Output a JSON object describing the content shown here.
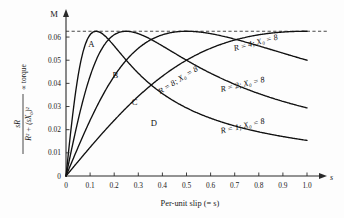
{
  "chart_data": {
    "type": "line",
    "title": "",
    "xlabel": "Per-unit slip (= s)",
    "x_axis_symbol": "s",
    "ylabel_numerator": "sR",
    "ylabel_denominator": "R² + (sX₀)²",
    "ylabel_suffix": "∝ torque",
    "y_axis_symbol": "M",
    "xlim": [
      0,
      1.0
    ],
    "ylim": [
      0,
      0.0665
    ],
    "grid": false,
    "legend_position": "inline-on-curves",
    "x_ticks": [
      "0",
      "0.1",
      "0.2",
      "0.3",
      "0.4",
      "0.5",
      "0.6",
      "0.7",
      "0.8",
      "0.9",
      "1.0"
    ],
    "x_tick_values": [
      0,
      0.1,
      0.2,
      0.3,
      0.4,
      0.5,
      0.6,
      0.7,
      0.8,
      0.9,
      1.0
    ],
    "y_ticks": [
      "0",
      "0.01",
      "0.02",
      "0.03",
      "0.04",
      "0.05",
      "0.06"
    ],
    "y_tick_values": [
      0,
      0.01,
      0.02,
      0.03,
      0.04,
      0.05,
      0.06
    ],
    "annotations": [
      {
        "name": "max-torque-line",
        "text": "",
        "kind": "dashed-horizontal",
        "y": 0.0625
      }
    ],
    "curve_letters": [
      {
        "label": "A",
        "x": 0.105,
        "y": 0.0555
      },
      {
        "label": "B",
        "x": 0.205,
        "y": 0.0425
      },
      {
        "label": "C",
        "x": 0.285,
        "y": 0.0305
      },
      {
        "label": "D",
        "x": 0.365,
        "y": 0.0215
      }
    ],
    "series": [
      {
        "name": "A",
        "label": "R = 1; X₀ = 8",
        "label_x": 0.735,
        "label_y": 0.0205,
        "label_rotate": -13,
        "R": 1,
        "X0": 8,
        "peak_x": 0.125,
        "peak_y": 0.0625,
        "x": [
          0.0,
          0.01,
          0.02,
          0.03,
          0.04,
          0.05,
          0.06,
          0.07,
          0.08,
          0.09,
          0.1,
          0.115,
          0.125,
          0.14,
          0.16,
          0.18,
          0.2,
          0.25,
          0.3,
          0.35,
          0.4,
          0.45,
          0.5,
          0.55,
          0.6,
          0.65,
          0.7,
          0.75,
          0.8,
          0.85,
          0.9,
          0.95,
          1.0
        ],
        "values": [
          0.0,
          0.00985,
          0.01923,
          0.02752,
          0.03448,
          0.04,
          0.04412,
          0.04717,
          0.04938,
          0.05096,
          0.05208,
          0.05298,
          0.05333,
          0.05348,
          0.05319,
          0.05251,
          0.05165,
          0.04898,
          0.04615,
          0.04348,
          0.04103,
          0.03883,
          0.03684,
          0.03505,
          0.03344,
          0.03198,
          0.03065,
          0.02944,
          0.02834,
          0.02732,
          0.02639,
          0.02552,
          0.02472
        ]
      },
      {
        "name": "B",
        "label": "R = 2; X₀ = 8",
        "label_x": 0.735,
        "label_y": 0.0385,
        "label_rotate": -13,
        "R": 2,
        "X0": 8,
        "peak_x": 0.25,
        "peak_y": 0.0625,
        "x": [
          0.0,
          0.02,
          0.04,
          0.06,
          0.08,
          0.1,
          0.13,
          0.16,
          0.19,
          0.22,
          0.25,
          0.28,
          0.32,
          0.36,
          0.4,
          0.45,
          0.5,
          0.55,
          0.6,
          0.65,
          0.7,
          0.75,
          0.8,
          0.85,
          0.9,
          0.95,
          1.0
        ],
        "values": [
          0.0,
          0.00995,
          0.01961,
          0.02885,
          0.03756,
          0.04545,
          0.05556,
          0.06061,
          0.06202,
          0.06173,
          0.0625,
          0.06186,
          0.06061,
          0.05882,
          0.05714,
          0.05479,
          0.05263,
          0.05063,
          0.04878,
          0.04706,
          0.04545,
          0.04396,
          0.04255,
          0.04124,
          0.04,
          0.03883,
          0.03774
        ]
      },
      {
        "name": "C",
        "label": "R = 4; X₀ = 8",
        "label_x": 0.79,
        "label_y": 0.0565,
        "label_rotate": -15,
        "R": 4,
        "X0": 8,
        "peak_x": 0.5,
        "peak_y": 0.0625,
        "x": [
          0.0,
          0.03,
          0.06,
          0.09,
          0.12,
          0.16,
          0.2,
          0.25,
          0.3,
          0.35,
          0.4,
          0.45,
          0.5,
          0.55,
          0.6,
          0.65,
          0.7,
          0.75,
          0.8,
          0.85,
          0.9,
          0.95,
          1.0
        ],
        "values": [
          0.0,
          0.00749,
          0.01485,
          0.02195,
          0.02874,
          0.03704,
          0.04444,
          0.05208,
          0.05769,
          0.06154,
          0.0641,
          0.06557,
          0.0625,
          0.06173,
          0.06061,
          0.05926,
          0.05776,
          0.05618,
          0.05455,
          0.05291,
          0.05128,
          0.04969,
          0.04813
        ]
      },
      {
        "name": "D",
        "label": "R = 8; X₀ = 8",
        "label_x": 0.47,
        "label_y": 0.0405,
        "label_rotate": -32,
        "R": 8,
        "X0": 8,
        "peak_x": 1.0,
        "peak_y": 0.0625,
        "x": [
          0.0,
          0.05,
          0.1,
          0.15,
          0.2,
          0.25,
          0.3,
          0.35,
          0.4,
          0.45,
          0.5,
          0.55,
          0.6,
          0.65,
          0.7,
          0.75,
          0.8,
          0.85,
          0.9,
          0.95,
          1.0
        ],
        "values": [
          0.0,
          0.00621,
          0.0122,
          0.01792,
          0.02326,
          0.02825,
          0.03286,
          0.03708,
          0.04094,
          0.04444,
          0.04762,
          0.05048,
          0.05306,
          0.05537,
          0.05744,
          0.0593,
          0.06096,
          0.06244,
          0.06376,
          0.06494,
          0.0625
        ]
      }
    ]
  }
}
